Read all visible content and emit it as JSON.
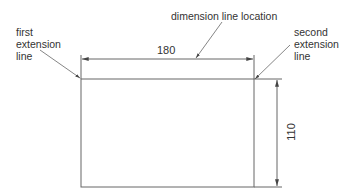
{
  "diagram": {
    "shape": "rectangle",
    "dimensions": {
      "horizontal": {
        "value": "180",
        "label": "dimension line location"
      },
      "vertical": {
        "value": "110"
      }
    },
    "labels": {
      "first_extension": [
        "first",
        "extension",
        "line"
      ],
      "second_extension": [
        "second",
        "extension",
        "line"
      ],
      "dimension_line_location": "dimension line location"
    },
    "colors": {
      "line": "#555555",
      "text": "#333333",
      "background": "#ffffff"
    }
  }
}
